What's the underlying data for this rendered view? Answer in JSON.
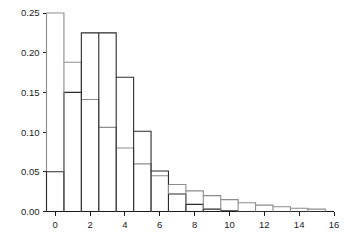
{
  "chart_data": {
    "type": "bar",
    "title": "",
    "subtitle": "",
    "xlabel": "",
    "ylabel": "",
    "xlim": [
      -0.5,
      16.0
    ],
    "ylim": [
      0.0,
      0.25
    ],
    "grid": false,
    "legend": "none",
    "bin_width": 1,
    "bin_edges": [
      -0.5,
      0.5,
      1.5,
      2.5,
      3.5,
      4.5,
      5.5,
      6.5,
      7.5,
      8.5,
      9.5,
      10.5,
      11.5,
      12.5,
      13.5,
      14.5,
      15.5
    ],
    "categories": [
      0,
      1,
      2,
      3,
      4,
      5,
      6,
      7,
      8,
      9,
      10,
      11,
      12,
      13,
      14,
      15
    ],
    "xticks": [
      0,
      2,
      4,
      6,
      8,
      10,
      12,
      14,
      16
    ],
    "xtick_labels": [
      "0",
      "2",
      "4",
      "6",
      "8",
      "10",
      "12",
      "14",
      "16"
    ],
    "yticks": [
      0.0,
      0.05,
      0.1,
      0.15,
      0.2,
      0.25
    ],
    "ytick_labels": [
      "0.00",
      "0.05",
      "0.10",
      "0.15",
      "0.20",
      "0.25"
    ],
    "series": [
      {
        "name": "series-gray",
        "color": "#8c8c8c",
        "linewidth": 1.1,
        "values": [
          0.25,
          0.188,
          0.141,
          0.106,
          0.08,
          0.06,
          0.045,
          0.034,
          0.026,
          0.02,
          0.015,
          0.011,
          0.008,
          0.006,
          0.004,
          0.003
        ]
      },
      {
        "name": "series-black",
        "color": "#2b2b2b",
        "linewidth": 1.1,
        "values": [
          0.05,
          0.15,
          0.225,
          0.225,
          0.169,
          0.101,
          0.051,
          0.022,
          0.009,
          0.003,
          0.001,
          0.0,
          0.0,
          0.0,
          0.0,
          0.0
        ]
      }
    ]
  },
  "colors": {
    "background": "#ffffff",
    "axis": "#1a1a1a",
    "gray_series": "#8c8c8c",
    "black_series": "#2b2b2b"
  }
}
